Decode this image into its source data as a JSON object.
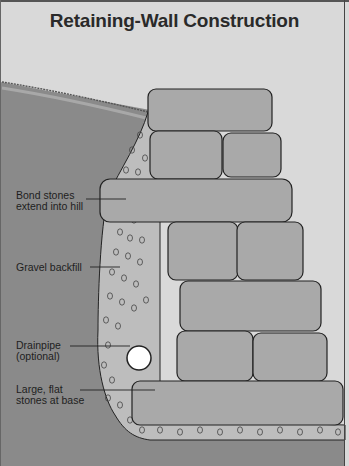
{
  "title": "Retaining-Wall Construction",
  "callouts": [
    {
      "id": "bond-stones",
      "line1": "Bond stones",
      "line2": "extend into hill"
    },
    {
      "id": "gravel-backfill",
      "line1": "Gravel backfill",
      "line2": ""
    },
    {
      "id": "drainpipe",
      "line1": "Drainpipe",
      "line2": "(optional)"
    },
    {
      "id": "base-stones",
      "line1": "Large, flat",
      "line2": "stones at base"
    }
  ],
  "colors": {
    "sky": "#d9d9d9",
    "hill": "#8a8a8a",
    "gravel": "#bdbdbd",
    "stone": "#a9a9a9",
    "outline": "#222222",
    "pipe": "#ffffff"
  }
}
